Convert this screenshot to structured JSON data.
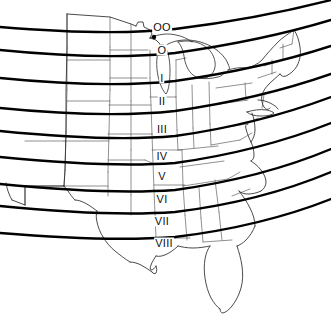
{
  "figure": {
    "name": "us-seismic-zone-map",
    "width": 331,
    "height": 321,
    "background_color": "#ffffff"
  },
  "style": {
    "isoline_color": "#000000",
    "coast_color": "#2b2b2b",
    "state_border_color": "#555555",
    "label_color": "#101010"
  },
  "zone_labels": [
    {
      "text": "OO",
      "x": 162,
      "y": 27
    },
    {
      "text": "O",
      "x": 162,
      "y": 50
    },
    {
      "text": "I",
      "x": 162,
      "y": 78
    },
    {
      "text": "II",
      "x": 162,
      "y": 101
    },
    {
      "text": "III",
      "x": 162,
      "y": 129
    },
    {
      "text": "IV",
      "x": 162,
      "y": 156
    },
    {
      "text": "V",
      "x": 162,
      "y": 176
    },
    {
      "text": "VI",
      "x": 162,
      "y": 199
    },
    {
      "text": "VII",
      "x": 162,
      "y": 221
    },
    {
      "text": "VIII",
      "x": 164,
      "y": 243
    }
  ],
  "isolines": [
    {
      "id": "iso-00",
      "d": "M 0,27 C 60,32 120,35 175,29 C 232,22 288,11 331,0"
    },
    {
      "id": "iso-0",
      "d": "M 0,50 C 60,56 120,59 175,53 C 232,45 288,33 331,20"
    },
    {
      "id": "iso-i",
      "d": "M 0,78 C 60,84 120,87 175,81 C 232,73 288,60 331,46"
    },
    {
      "id": "iso-ii",
      "d": "M 0,108 C 60,114 120,117 175,111 C 232,103 288,89 331,74"
    },
    {
      "id": "iso-iii",
      "d": "M 0,131 C 60,137 120,141 175,136 C 232,128 288,113 331,97"
    },
    {
      "id": "iso-iv",
      "d": "M 0,157 C 60,163 120,167 175,163 C 232,155 288,140 331,123"
    },
    {
      "id": "iso-v",
      "d": "M 0,184 C 60,190 120,194 175,190 C 232,182 288,167 331,149"
    },
    {
      "id": "iso-vi",
      "d": "M 0,206 C 60,212 120,216 175,212 C 232,205 288,190 331,172"
    },
    {
      "id": "iso-vii",
      "d": "M 0,233 C 60,238 120,241 175,237 C 232,230 288,216 331,199"
    }
  ],
  "geography": {
    "coastline_name": "conterminous-united-states-outline",
    "lakes_name": "great-lakes-outline",
    "state_borders_name": "state-boundary-lines"
  }
}
